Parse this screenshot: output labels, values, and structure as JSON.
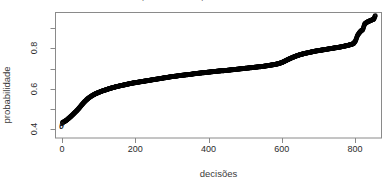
{
  "figure": {
    "title_clipped": "probabilidade por decisao",
    "background_color": "#ffffff",
    "frame_color": "#808080",
    "point_color": "#000000",
    "annotation_theta": "θ"
  },
  "chart_data": {
    "type": "scatter",
    "title": "",
    "xlabel": "decisões",
    "ylabel": "probabilidade",
    "xlim": [
      -18,
      872
    ],
    "ylim": [
      0.355,
      0.978
    ],
    "xticks": [
      0,
      200,
      400,
      600,
      800
    ],
    "xtick_labels": [
      "0",
      "200",
      "400",
      "600",
      "800"
    ],
    "yticks": [
      0.4,
      0.6,
      0.8
    ],
    "ytick_labels": [
      "0.4",
      "0.6",
      "0.8"
    ],
    "yticks_minor": [
      0.5,
      0.7,
      0.9
    ],
    "grid": false,
    "legend": null,
    "marker": "open-circle",
    "n_points": 855,
    "series": [
      {
        "name": "probabilidade ordenada",
        "x": [
          1,
          6,
          11,
          16,
          21,
          26,
          31,
          36,
          41,
          46,
          51,
          56,
          61,
          66,
          71,
          76,
          81,
          86,
          91,
          96,
          101,
          111,
          121,
          131,
          141,
          151,
          161,
          171,
          181,
          191,
          201,
          211,
          221,
          231,
          241,
          251,
          261,
          271,
          281,
          291,
          301,
          311,
          321,
          331,
          341,
          351,
          361,
          371,
          381,
          391,
          401,
          411,
          421,
          431,
          441,
          451,
          461,
          471,
          481,
          491,
          501,
          511,
          521,
          531,
          541,
          551,
          561,
          571,
          581,
          591,
          601,
          611,
          621,
          631,
          641,
          651,
          661,
          671,
          681,
          691,
          701,
          711,
          721,
          731,
          741,
          751,
          761,
          771,
          781,
          791,
          796,
          801,
          806,
          811,
          816,
          821,
          826,
          831,
          836,
          841,
          846,
          851,
          855
        ],
        "y": [
          0.431,
          0.436,
          0.442,
          0.449,
          0.457,
          0.465,
          0.474,
          0.483,
          0.492,
          0.502,
          0.513,
          0.524,
          0.534,
          0.543,
          0.551,
          0.558,
          0.564,
          0.569,
          0.574,
          0.578,
          0.582,
          0.589,
          0.595,
          0.601,
          0.606,
          0.611,
          0.615,
          0.619,
          0.623,
          0.627,
          0.63,
          0.633,
          0.636,
          0.639,
          0.642,
          0.645,
          0.648,
          0.651,
          0.654,
          0.657,
          0.66,
          0.662,
          0.665,
          0.667,
          0.669,
          0.671,
          0.674,
          0.676,
          0.678,
          0.68,
          0.682,
          0.684,
          0.686,
          0.688,
          0.689,
          0.691,
          0.693,
          0.695,
          0.697,
          0.699,
          0.701,
          0.703,
          0.705,
          0.707,
          0.709,
          0.711,
          0.714,
          0.717,
          0.72,
          0.724,
          0.73,
          0.739,
          0.748,
          0.756,
          0.763,
          0.769,
          0.774,
          0.778,
          0.782,
          0.786,
          0.789,
          0.792,
          0.795,
          0.798,
          0.801,
          0.804,
          0.807,
          0.811,
          0.815,
          0.82,
          0.824,
          0.836,
          0.862,
          0.876,
          0.886,
          0.893,
          0.921,
          0.928,
          0.933,
          0.937,
          0.941,
          0.945,
          0.962
        ]
      }
    ]
  },
  "axes": {
    "x_title": "decisões",
    "y_title": "probabilidade"
  }
}
